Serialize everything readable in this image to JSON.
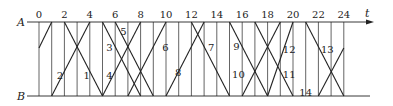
{
  "diagram": {
    "axis_label_top": "A",
    "axis_label_bottom": "B",
    "time_label": "t",
    "ticks": [
      "0",
      "2",
      "4",
      "6",
      "8",
      "10",
      "12",
      "14",
      "16",
      "18",
      "20",
      "22",
      "24"
    ],
    "tick_values": [
      0,
      2,
      4,
      6,
      8,
      10,
      12,
      14,
      16,
      18,
      20,
      22,
      24
    ],
    "grid_times": [
      0,
      1,
      2,
      3,
      4,
      5,
      6,
      7,
      8,
      9,
      10,
      11,
      12,
      13,
      14,
      15,
      16,
      17,
      18,
      19,
      20,
      21,
      22,
      23,
      24
    ],
    "line_color": "#222222",
    "segments": [
      {
        "from": [
          0,
          0.35
        ],
        "to": [
          1,
          0
        ]
      },
      {
        "from": [
          2,
          0
        ],
        "to": [
          5,
          1
        ]
      },
      {
        "from": [
          1,
          1
        ],
        "to": [
          4,
          0
        ]
      },
      {
        "from": [
          5,
          0
        ],
        "to": [
          8,
          1
        ]
      },
      {
        "from": [
          6,
          0
        ],
        "to": [
          9,
          1
        ]
      },
      {
        "from": [
          5,
          1
        ],
        "to": [
          8,
          0
        ]
      },
      {
        "from": [
          7,
          1
        ],
        "to": [
          10,
          0
        ]
      },
      {
        "from": [
          12,
          0
        ],
        "to": [
          15,
          1
        ]
      },
      {
        "from": [
          10,
          1
        ],
        "to": [
          13,
          0
        ]
      },
      {
        "from": [
          15,
          0
        ],
        "to": [
          18,
          1
        ]
      },
      {
        "from": [
          17,
          0
        ],
        "to": [
          20,
          1
        ]
      },
      {
        "from": [
          16,
          1
        ],
        "to": [
          19,
          0
        ]
      },
      {
        "from": [
          18,
          1
        ],
        "to": [
          20,
          0
        ]
      },
      {
        "from": [
          21,
          0
        ],
        "to": [
          24,
          1
        ]
      },
      {
        "from": [
          22,
          1
        ],
        "to": [
          24,
          0.35
        ]
      }
    ],
    "numbers": [
      {
        "text": "1",
        "t": 3.5,
        "y": 0.72
      },
      {
        "text": "2",
        "t": 1.4,
        "y": 0.72
      },
      {
        "text": "3",
        "t": 5.3,
        "y": 0.34
      },
      {
        "text": "4",
        "t": 5.3,
        "y": 0.72
      },
      {
        "text": "5",
        "t": 6.4,
        "y": 0.12
      },
      {
        "text": "6",
        "t": 9.7,
        "y": 0.34
      },
      {
        "text": "7",
        "t": 13.3,
        "y": 0.34
      },
      {
        "text": "8",
        "t": 10.7,
        "y": 0.67
      },
      {
        "text": "9",
        "t": 15.3,
        "y": 0.32
      },
      {
        "text": "10",
        "t": 15.2,
        "y": 0.7
      },
      {
        "text": "11",
        "t": 19.2,
        "y": 0.7
      },
      {
        "text": "12",
        "t": 19.2,
        "y": 0.36
      },
      {
        "text": "13",
        "t": 22.2,
        "y": 0.36
      },
      {
        "text": "14",
        "t": 20.5,
        "y": 0.95
      }
    ]
  }
}
